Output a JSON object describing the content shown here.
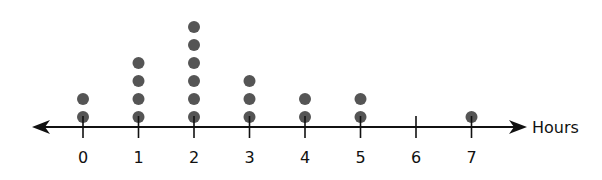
{
  "chart_data": {
    "type": "dot",
    "title": "",
    "xlabel": "Hours",
    "ylabel": "",
    "categories": [
      0,
      1,
      2,
      3,
      4,
      5,
      6,
      7
    ],
    "values": [
      2,
      4,
      6,
      3,
      2,
      2,
      0,
      1
    ],
    "xlim": [
      0,
      7
    ],
    "grid": false,
    "legend": null
  },
  "axis": {
    "label": "Hours",
    "ticks": [
      "0",
      "1",
      "2",
      "3",
      "4",
      "5",
      "6",
      "7"
    ]
  },
  "colors": {
    "dot": "#555555",
    "axis": "#111111"
  }
}
